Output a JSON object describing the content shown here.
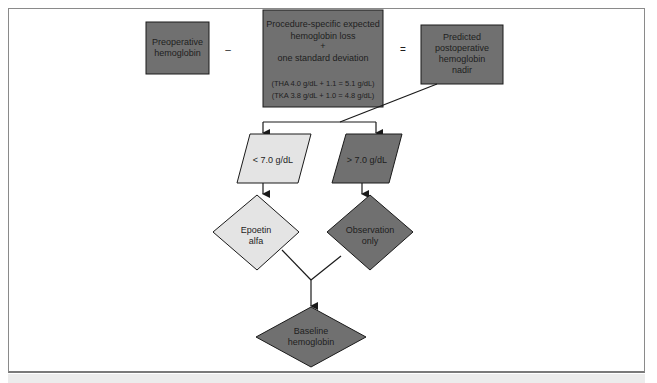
{
  "diagram": {
    "title": "",
    "colors": {
      "dark_fill": "#707070",
      "light_fill": "#e4e4e4",
      "stroke": "#1a1a1a",
      "frame": "#8a8a8a",
      "footer_band": "#ececec"
    },
    "nodes": {
      "preoperative": {
        "shape": "rectangle",
        "fill": "dark",
        "lines": [
          "Preoperative",
          "hemoglobin"
        ]
      },
      "expected_loss": {
        "shape": "rectangle",
        "fill": "dark",
        "lines": [
          "Procedure-specific expected",
          "hemoglobin loss",
          "+",
          "one standard deviation"
        ],
        "detail_lines": [
          "(THA 4.0 g/dL + 1.1 = 5.1 g/dL)",
          "(TKA 3.8 g/dL + 1.0 = 4.8 g/dL)"
        ]
      },
      "predicted_nadir": {
        "shape": "rectangle",
        "fill": "dark",
        "lines": [
          "Predicted",
          "postoperative",
          "hemoglobin",
          "nadir"
        ]
      },
      "below_threshold": {
        "shape": "parallelogram",
        "fill": "light",
        "lines": [
          "< 7.0 g/dL"
        ]
      },
      "above_threshold": {
        "shape": "parallelogram",
        "fill": "dark",
        "lines": [
          "> 7.0 g/dL"
        ]
      },
      "epoetin": {
        "shape": "diamond",
        "fill": "light",
        "lines": [
          "Epoetin",
          "alfa"
        ]
      },
      "observation": {
        "shape": "diamond",
        "fill": "dark",
        "lines": [
          "Observation",
          "only"
        ]
      },
      "baseline": {
        "shape": "diamond",
        "fill": "dark",
        "lines": [
          "Baseline",
          "hemoglobin"
        ]
      }
    },
    "operators": {
      "minus": "–",
      "equals": "="
    },
    "edges": [
      {
        "from": "predicted_nadir",
        "to": "below_threshold",
        "arrow": true
      },
      {
        "from": "predicted_nadir",
        "to": "above_threshold",
        "arrow": true
      },
      {
        "from": "below_threshold",
        "to": "epoetin",
        "arrow": true
      },
      {
        "from": "above_threshold",
        "to": "observation",
        "arrow": true
      },
      {
        "from": "epoetin",
        "to": "baseline",
        "arrow": true,
        "via": "join"
      },
      {
        "from": "observation",
        "to": "baseline",
        "arrow": true,
        "via": "join"
      }
    ]
  }
}
